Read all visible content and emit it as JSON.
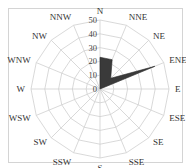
{
  "chart_data": {
    "type": "radar",
    "subtype": "wind-rose",
    "title": "",
    "categories": [
      "N",
      "NNE",
      "NE",
      "ENE",
      "E",
      "ESE",
      "SE",
      "SSE",
      "S",
      "SSW",
      "SW",
      "WSW",
      "W",
      "WNW",
      "NW",
      "NNW"
    ],
    "series": [
      {
        "name": "",
        "values": [
          23,
          23,
          11,
          43,
          0,
          0,
          0,
          0,
          0,
          0,
          0,
          0,
          0,
          0,
          0,
          0
        ],
        "color": "#3a3a3a"
      }
    ],
    "radial_axis": {
      "min": 0,
      "max": 50,
      "ticks": [
        0,
        10,
        20,
        30,
        40,
        50
      ]
    },
    "grid": true,
    "grid_shape": "polygon",
    "legend": "none"
  },
  "style": {
    "grid_color": "#cfcfcf",
    "series_color": "#3a3a3a",
    "frame_color": "#d4d4d4"
  }
}
